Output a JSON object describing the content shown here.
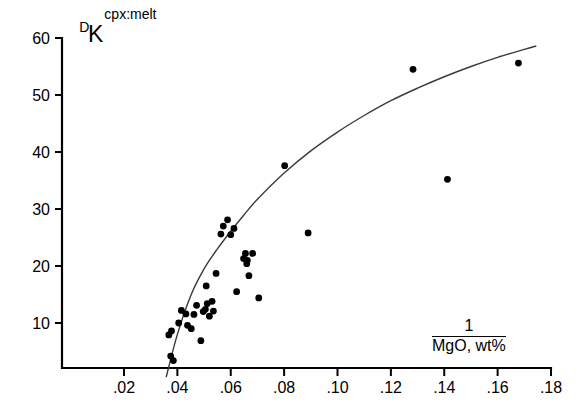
{
  "chart_data": {
    "type": "scatter",
    "title": "",
    "ylabel": "K_D^{cpx:melt}",
    "ylabel_base": "K",
    "ylabel_sup": "cpx:melt",
    "ylabel_sub": "D",
    "xlabel": "1 / MgO, wt%",
    "xlabel_numerator": "1",
    "xlabel_denominator": "MgO, wt%",
    "xlim": [
      0.012,
      0.182
    ],
    "ylim": [
      0,
      63
    ],
    "xticks": [
      0.02,
      0.04,
      0.06,
      0.08,
      0.1,
      0.12,
      0.14,
      0.16,
      0.18
    ],
    "xtick_labels": [
      ".02",
      ".04",
      ".06",
      ".08",
      ".10",
      ".12",
      ".14",
      ".16",
      ".18"
    ],
    "yticks": [
      10,
      20,
      30,
      40,
      50,
      60
    ],
    "ytick_labels": [
      "10",
      "20",
      "30",
      "40",
      "50",
      "60"
    ],
    "grid": false,
    "legend": false,
    "point_color": "#000000",
    "curve_color": "#3a3a3a",
    "axis_color": "#000000",
    "series": [
      {
        "name": "cpx:melt partition data",
        "marker": "filled-circle",
        "points": [
          [
            0.0375,
            4.2
          ],
          [
            0.0385,
            3.4
          ],
          [
            0.0378,
            8.6
          ],
          [
            0.0368,
            7.9
          ],
          [
            0.0415,
            12.2
          ],
          [
            0.0405,
            10.0
          ],
          [
            0.0432,
            11.6
          ],
          [
            0.0438,
            9.6
          ],
          [
            0.0452,
            9.0
          ],
          [
            0.0462,
            11.5
          ],
          [
            0.0472,
            13.1
          ],
          [
            0.0488,
            6.9
          ],
          [
            0.0508,
            16.5
          ],
          [
            0.0512,
            13.4
          ],
          [
            0.0497,
            12.0
          ],
          [
            0.0505,
            12.4
          ],
          [
            0.052,
            11.2
          ],
          [
            0.053,
            13.8
          ],
          [
            0.0535,
            12.1
          ],
          [
            0.0545,
            18.7
          ],
          [
            0.0572,
            27.0
          ],
          [
            0.0588,
            28.1
          ],
          [
            0.0563,
            25.6
          ],
          [
            0.06,
            25.5
          ],
          [
            0.0612,
            26.6
          ],
          [
            0.0648,
            21.3
          ],
          [
            0.0655,
            22.2
          ],
          [
            0.066,
            20.4
          ],
          [
            0.0662,
            21.0
          ],
          [
            0.0682,
            22.2
          ],
          [
            0.0668,
            18.3
          ],
          [
            0.0622,
            15.5
          ],
          [
            0.0705,
            14.4
          ],
          [
            0.0802,
            37.6
          ],
          [
            0.089,
            25.8
          ],
          [
            0.1283,
            54.5
          ],
          [
            0.1412,
            35.2
          ],
          [
            0.1678,
            55.6
          ]
        ]
      }
    ],
    "fit_curve": {
      "name": "best-fit curve",
      "points": [
        [
          0.0358,
          0.5
        ],
        [
          0.04,
          8.0
        ],
        [
          0.045,
          14.8
        ],
        [
          0.05,
          19.5
        ],
        [
          0.055,
          23.0
        ],
        [
          0.06,
          26.1
        ],
        [
          0.065,
          29.0
        ],
        [
          0.07,
          31.7
        ],
        [
          0.08,
          36.3
        ],
        [
          0.09,
          40.2
        ],
        [
          0.1,
          43.5
        ],
        [
          0.11,
          46.4
        ],
        [
          0.12,
          49.0
        ],
        [
          0.13,
          51.2
        ],
        [
          0.14,
          53.2
        ],
        [
          0.15,
          55.0
        ],
        [
          0.16,
          56.6
        ],
        [
          0.17,
          58.0
        ],
        [
          0.1745,
          58.6
        ]
      ]
    }
  }
}
